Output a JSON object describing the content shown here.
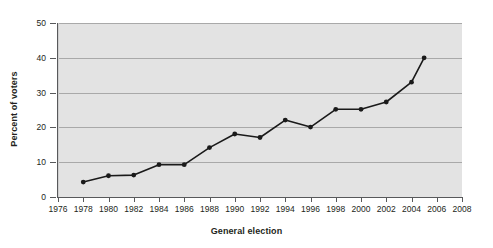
{
  "chart_data": {
    "type": "line",
    "title": "",
    "xlabel": "General election",
    "ylabel": "Percent of voters",
    "xlim": [
      1976,
      2008
    ],
    "ylim": [
      0,
      50
    ],
    "xticks": [
      1976,
      1978,
      1980,
      1982,
      1984,
      1986,
      1988,
      1990,
      1992,
      1994,
      1996,
      1998,
      2000,
      2002,
      2004,
      2006,
      2008
    ],
    "yticks": [
      0,
      10,
      20,
      30,
      40,
      50
    ],
    "grid": "horizontal",
    "legend": "none",
    "x": [
      1978,
      1980,
      1982,
      1984,
      1986,
      1988,
      1990,
      1992,
      1994,
      1996,
      1998,
      2000,
      2002,
      2004,
      2005
    ],
    "values": [
      4.3,
      6.1,
      6.3,
      9.3,
      9.3,
      14.2,
      18.1,
      17.1,
      22.1,
      20.1,
      25.2,
      25.2,
      27.3,
      33.0,
      40.0
    ],
    "series": [
      {
        "name": "Percent of voters",
        "marker": "filled-circle",
        "color": "#1a1a1a",
        "values": [
          4.3,
          6.1,
          6.3,
          9.3,
          9.3,
          14.2,
          18.1,
          17.1,
          22.1,
          20.1,
          25.2,
          25.2,
          27.3,
          33.0,
          40.0
        ]
      }
    ]
  },
  "axes": {
    "y_label": "Percent of voters",
    "x_label": "General election",
    "y_tick_labels": [
      "0",
      "10",
      "20",
      "30",
      "40",
      "50"
    ],
    "x_tick_labels": [
      "1976",
      "1978",
      "1980",
      "1982",
      "1984",
      "1986",
      "1988",
      "1990",
      "1992",
      "1994",
      "1996",
      "1998",
      "2000",
      "2002",
      "2004",
      "2006",
      "2008"
    ]
  },
  "style": {
    "plot_background": "#e3e3e3",
    "gridline_color": "#a9a9a9",
    "axis_color": "#58595b",
    "line_color": "#1a1a1a",
    "text_color": "#231f20",
    "page_background": "#ffffff"
  }
}
